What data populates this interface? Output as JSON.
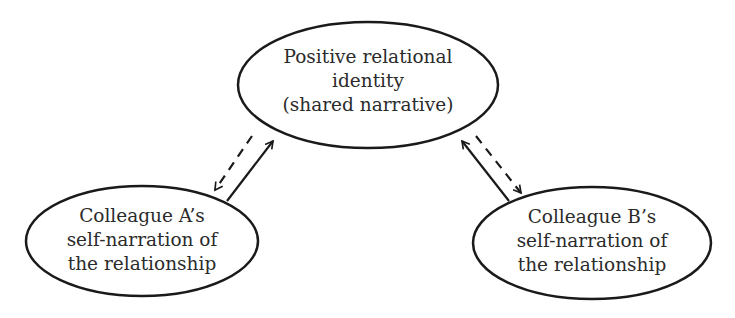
{
  "diagram": {
    "nodes": {
      "shared": {
        "lines": [
          "Positive relational",
          "identity",
          "(shared narrative)"
        ]
      },
      "colleague_a": {
        "lines": [
          "Colleague A’s",
          "self-narration of",
          "the relationship"
        ]
      },
      "colleague_b": {
        "lines": [
          "Colleague B’s",
          "self-narration of",
          "the relationship"
        ]
      }
    },
    "edges": [
      {
        "from": "shared",
        "to": "colleague_a",
        "style": "dashed",
        "arrow": "end"
      },
      {
        "from": "colleague_a",
        "to": "shared",
        "style": "solid",
        "arrow": "end"
      },
      {
        "from": "colleague_b",
        "to": "shared",
        "style": "solid",
        "arrow": "end"
      },
      {
        "from": "shared",
        "to": "colleague_b",
        "style": "dashed",
        "arrow": "end"
      }
    ],
    "colors": {
      "stroke": "#1a1a1a",
      "text": "#2b2b2b",
      "background": "#ffffff"
    }
  }
}
